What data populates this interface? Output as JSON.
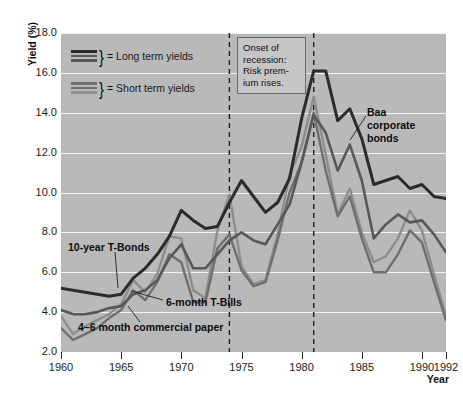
{
  "axes": {
    "y_title": "Yield (%)",
    "x_title": "Year",
    "y_ticks": [
      "18.0",
      "16.0",
      "14.0",
      "12.0",
      "10.0",
      "8.0",
      "6.0",
      "4.0",
      "2.0"
    ],
    "x_ticks": [
      "1960",
      "1965",
      "1970",
      "1975",
      "1980",
      "1985",
      "1990",
      "1992"
    ]
  },
  "legend": {
    "long_term": "= Long term yields",
    "short_term": "= Short term yields",
    "brace": "}"
  },
  "annotation": {
    "line1": "Onset of",
    "line2": "recession:",
    "line3": "Risk prem-",
    "line4": "ium rises."
  },
  "callouts": {
    "baa": "Baa corporate bonds",
    "tbonds": "10-year T-Bonds",
    "tbills": "6-month T-Bills",
    "commercial_paper": "4–6 month commercial paper"
  },
  "colors": {
    "plot_background": "#b9b9b9",
    "gridline": "#f2f2f2",
    "baa": "#2b2b2b",
    "tbonds": "#585858",
    "tbills": "#6f6f6f",
    "commercial_paper": "#8d8d8d",
    "recession_marker": "#1f1f1f"
  },
  "chart_data": {
    "type": "line",
    "title": "",
    "xlabel": "Year",
    "ylabel": "Yield (%)",
    "xlim": [
      1960,
      1992
    ],
    "ylim": [
      2.0,
      18.0
    ],
    "grid": true,
    "legend_position": "top-left inside plot",
    "annotations": [
      {
        "x": 1974,
        "type": "vertical-dashed-line",
        "text": "Onset of recession: Risk premium rises."
      },
      {
        "x": 1981,
        "type": "vertical-dashed-line",
        "text": ""
      }
    ],
    "x": [
      1960,
      1961,
      1962,
      1963,
      1964,
      1965,
      1966,
      1967,
      1968,
      1969,
      1970,
      1971,
      1972,
      1973,
      1974,
      1975,
      1976,
      1977,
      1978,
      1979,
      1980,
      1981,
      1982,
      1983,
      1984,
      1985,
      1986,
      1987,
      1988,
      1989,
      1990,
      1991,
      1992
    ],
    "series": [
      {
        "name": "Baa corporate bonds",
        "group": "long term",
        "color": "#2b2b2b",
        "values": [
          5.2,
          5.1,
          5.0,
          4.9,
          4.8,
          4.9,
          5.7,
          6.2,
          6.9,
          7.8,
          9.1,
          8.6,
          8.2,
          8.3,
          9.5,
          10.6,
          9.8,
          9.0,
          9.5,
          10.7,
          13.7,
          16.1,
          16.1,
          13.6,
          14.2,
          12.7,
          10.4,
          10.6,
          10.8,
          10.2,
          10.4,
          9.8,
          9.7
        ]
      },
      {
        "name": "10-year T-Bonds",
        "group": "long term",
        "color": "#585858",
        "values": [
          4.1,
          3.9,
          3.9,
          4.0,
          4.2,
          4.3,
          4.9,
          5.1,
          5.6,
          6.7,
          7.4,
          6.2,
          6.2,
          6.9,
          7.6,
          8.0,
          7.6,
          7.4,
          8.4,
          9.4,
          11.5,
          13.9,
          13.0,
          11.1,
          12.4,
          10.6,
          7.7,
          8.4,
          8.9,
          8.5,
          8.6,
          7.9,
          7.0
        ]
      },
      {
        "name": "6-month T-Bills",
        "group": "short term",
        "color": "#6f6f6f",
        "values": [
          3.2,
          2.6,
          2.9,
          3.2,
          3.7,
          4.1,
          5.1,
          4.6,
          5.5,
          6.9,
          6.5,
          4.5,
          4.5,
          7.2,
          7.9,
          6.1,
          5.3,
          5.5,
          7.6,
          10.0,
          11.5,
          14.0,
          11.1,
          8.8,
          9.8,
          7.7,
          6.0,
          6.0,
          6.9,
          8.1,
          7.5,
          5.5,
          3.6
        ]
      },
      {
        "name": "4–6 month commercial paper",
        "group": "short term",
        "color": "#8d8d8d",
        "values": [
          3.8,
          2.9,
          3.3,
          3.6,
          3.9,
          4.4,
          5.6,
          5.0,
          5.9,
          7.8,
          7.7,
          5.1,
          4.7,
          8.1,
          9.9,
          6.3,
          5.4,
          5.6,
          7.9,
          10.9,
          12.3,
          14.8,
          11.9,
          8.9,
          10.2,
          8.0,
          6.5,
          6.8,
          7.7,
          9.1,
          8.1,
          5.9,
          3.8
        ]
      }
    ]
  }
}
